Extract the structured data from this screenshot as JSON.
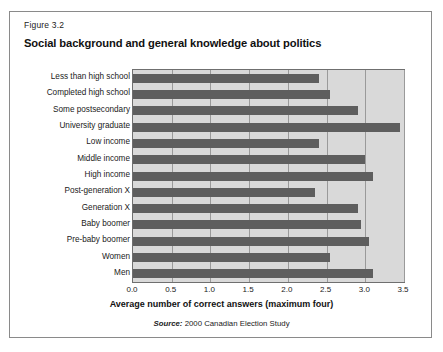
{
  "figure": {
    "number_label": "Figure 3.2",
    "title": "Social background and general knowledge about politics",
    "source_prefix": "Source:",
    "source_text": "2000 Canadian Election Study"
  },
  "colors": {
    "bar": "#5e5e5e",
    "plot_background": "#d9d9d9",
    "gridline": "#9a9a9a",
    "border": "#8a8a8a",
    "text": "#1a1a1a"
  },
  "chart_data": {
    "type": "bar",
    "orientation": "horizontal",
    "title": "Social background and general knowledge about politics",
    "xlabel": "Average number of correct answers (maximum four)",
    "ylabel": "",
    "xlim": [
      0.0,
      3.5
    ],
    "xticks": [
      0.0,
      0.5,
      1.0,
      1.5,
      2.0,
      2.5,
      3.0,
      3.5
    ],
    "xtick_labels": [
      "0.0",
      "0.5",
      "1.0",
      "1.5",
      "2.0",
      "2.5",
      "3.0",
      "3.5"
    ],
    "grid": "vertical",
    "legend": "none",
    "categories": [
      "Less than high school",
      "Completed high school",
      "Some postsecondary",
      "University graduate",
      "Low income",
      "Middle income",
      "High income",
      "Post-generation X",
      "Generation X",
      "Baby boomer",
      "Pre-baby boomer",
      "Women",
      "Men"
    ],
    "values": [
      2.4,
      2.55,
      2.9,
      3.45,
      2.4,
      3.0,
      3.1,
      2.35,
      2.9,
      2.95,
      3.05,
      2.55,
      3.1
    ]
  }
}
